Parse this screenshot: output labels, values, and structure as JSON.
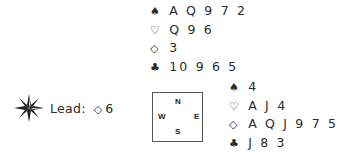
{
  "north": {
    "spades": "AQ972",
    "hearts": "Q96",
    "diamonds": "3",
    "clubs": "10965"
  },
  "east": {
    "spades": "4",
    "hearts": "AJ4",
    "diamonds": "AQJ975",
    "clubs": "J83"
  },
  "suits": {
    "spades": "♠",
    "hearts": "♡",
    "diamonds": "◇",
    "clubs": "♣"
  },
  "compass": {
    "n": "N",
    "e": "E",
    "s": "S",
    "w": "W"
  },
  "lead": {
    "label": "Lead:",
    "suit": "◇",
    "rank": "6",
    "icon": "compass-star-icon"
  }
}
